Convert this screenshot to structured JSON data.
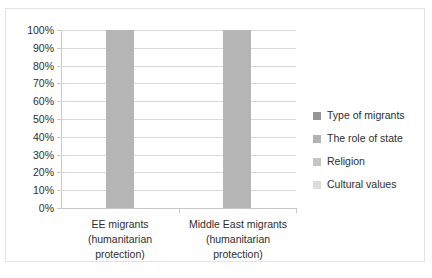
{
  "chart_data": {
    "type": "bar",
    "subtype": "100% stacked column",
    "title": "",
    "xlabel": "",
    "ylabel": "",
    "ylim": [
      0,
      100
    ],
    "grid": true,
    "legend_position": "right",
    "categories": [
      "EE migrants (humanitarian protection)",
      "Middle East migrants (humanitarian protection)"
    ],
    "category_lines": [
      [
        "EE migrants",
        "(humanitarian",
        "protection)"
      ],
      [
        "Middle East migrants",
        "(humanitarian",
        "protection)"
      ]
    ],
    "ytick_labels": [
      "100%",
      "90%",
      "80%",
      "70%",
      "60%",
      "50%",
      "40%",
      "30%",
      "20%",
      "10%",
      "0%"
    ],
    "ytick_values": [
      100,
      90,
      80,
      70,
      60,
      50,
      40,
      30,
      20,
      10,
      0
    ],
    "series": [
      {
        "name": "Type of migrants",
        "color": "#959595",
        "values": [
          100,
          100
        ]
      },
      {
        "name": "The role of state",
        "color": "#b2b2b2",
        "values": [
          0,
          0
        ]
      },
      {
        "name": "Religion",
        "color": "#c4c4c4",
        "values": [
          0,
          0
        ]
      },
      {
        "name": "Cultural values",
        "color": "#dcdcdc",
        "values": [
          0,
          0
        ]
      }
    ],
    "bar_totals": [
      100,
      100
    ],
    "bar_fill_color": "#b5b5b5"
  },
  "legend": {
    "entries": [
      {
        "label": "Type of migrants"
      },
      {
        "label": "The role of state"
      },
      {
        "label": "Religion"
      },
      {
        "label": "Cultural values"
      }
    ]
  }
}
